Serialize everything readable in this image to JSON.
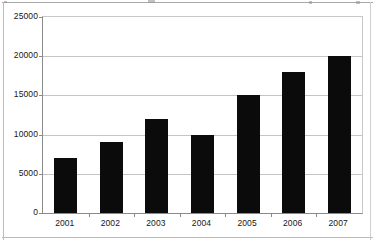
{
  "chart_data": {
    "type": "bar",
    "title": "",
    "subtitle": "",
    "xlabel": "",
    "ylabel": "",
    "categories": [
      "2001",
      "2002",
      "2003",
      "2004",
      "2005",
      "2006",
      "2007"
    ],
    "values": [
      7000,
      9000,
      12000,
      10000,
      15000,
      18000,
      20000
    ],
    "series": [
      {
        "name": "",
        "values": [
          7000,
          9000,
          12000,
          10000,
          15000,
          18000,
          20000
        ]
      }
    ],
    "ylim": [
      0,
      25000
    ],
    "ytick_labels": [
      "0",
      "5000",
      "10000",
      "15000",
      "20000",
      "25000"
    ],
    "ytick_values": [
      0,
      5000,
      10000,
      15000,
      20000,
      25000
    ],
    "xtick_labels": [
      "2001",
      "2002",
      "2003",
      "2004",
      "2005",
      "2006",
      "2007"
    ],
    "grid": true,
    "grid_axis": "y",
    "legend": false,
    "legend_position": "none",
    "bar_color": "#0b0b0b",
    "plot_background": "#ffffff",
    "gridline_color": "#c4c4c4",
    "axis_color": "#8a8a8a"
  },
  "page": {
    "background": "#ffffff",
    "frame_color": "#b9b9b9"
  }
}
